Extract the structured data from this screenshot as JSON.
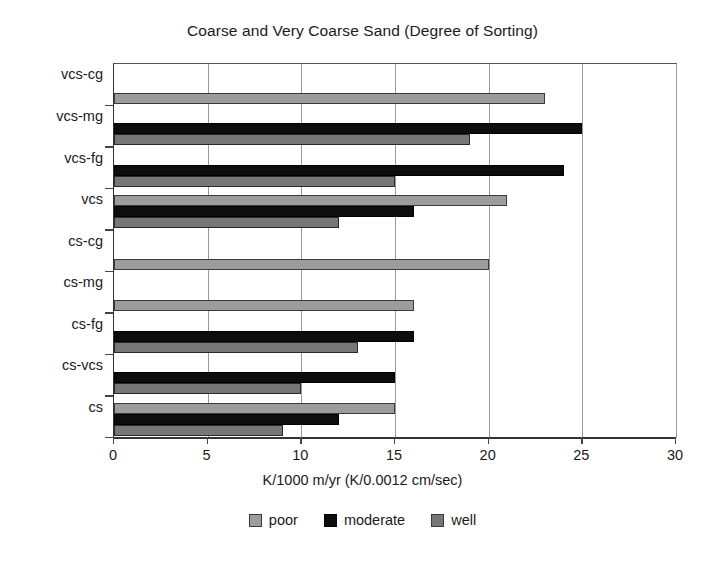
{
  "chart_data": {
    "type": "bar",
    "orientation": "horizontal",
    "title": "Coarse and Very Coarse Sand (Degree of Sorting)",
    "xlabel": "K/1000 m/yr (K/0.0012 cm/sec)",
    "ylabel": "",
    "xlim": [
      0,
      30
    ],
    "xticks": [
      0,
      5,
      10,
      15,
      20,
      25,
      30
    ],
    "xtick_labels": [
      "0",
      "5",
      "10",
      "15",
      "20",
      "25",
      "30"
    ],
    "grid": true,
    "grid_axis": "x",
    "legend_position": "bottom",
    "categories": [
      "vcs-cg",
      "vcs-mg",
      "vcs-fg",
      "vcs",
      "cs-cg",
      "cs-mg",
      "cs-fg",
      "cs-vcs",
      "cs"
    ],
    "series": [
      {
        "name": "poor",
        "color": "#9c9c9c",
        "values": [
          23,
          null,
          null,
          21,
          20,
          16,
          null,
          null,
          15
        ]
      },
      {
        "name": "moderate",
        "color": "#0d0d0d",
        "values": [
          null,
          25,
          24,
          16,
          null,
          null,
          16,
          15,
          12
        ]
      },
      {
        "name": "well",
        "color": "#777777",
        "values": [
          null,
          19,
          15,
          12,
          null,
          null,
          13,
          10,
          9
        ]
      }
    ]
  },
  "legend": {
    "items": [
      {
        "label": "poor",
        "key": "poor"
      },
      {
        "label": "moderate",
        "key": "moderate"
      },
      {
        "label": "well",
        "key": "well"
      }
    ]
  },
  "colors": {
    "poor": "#9c9c9c",
    "moderate": "#0d0d0d",
    "well": "#777777",
    "axis": "#333333",
    "grid": "#9a9a9a",
    "background": "#ffffff",
    "text": "#1a1a1a"
  }
}
